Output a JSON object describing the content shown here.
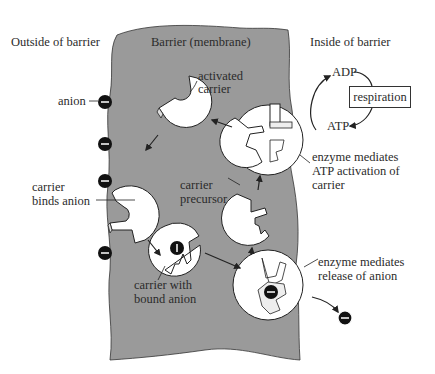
{
  "figure": {
    "type": "membrane carrier transport diagram",
    "regions": {
      "outside": "Outside of barrier",
      "barrier": "Barrier (membrane)",
      "inside": "Inside of barrier"
    },
    "labels": {
      "anion": "anion",
      "activated_carrier_1": "activated",
      "activated_carrier_2": "carrier",
      "carrier_binds_1": "carrier",
      "carrier_binds_2": "binds anion",
      "carrier_precursor_1": "carrier",
      "carrier_precursor_2": "precursor",
      "carrier_bound_1": "carrier with",
      "carrier_bound_2": "bound anion",
      "enzyme_atp_1": "enzyme mediates",
      "enzyme_atp_2": "ATP activation of",
      "enzyme_atp_3": "carrier",
      "enzyme_release_1": "enzyme mediates",
      "enzyme_release_2": "release of anion",
      "adp": "ADP",
      "atp": "ATP",
      "respiration": "respiration"
    },
    "anion_symbol": "−",
    "colors": {
      "membrane": "#9a9a9a",
      "carrier": "#ffffff",
      "anion": "#111111",
      "ink": "#2b2b2b",
      "background": "#ffffff"
    }
  }
}
